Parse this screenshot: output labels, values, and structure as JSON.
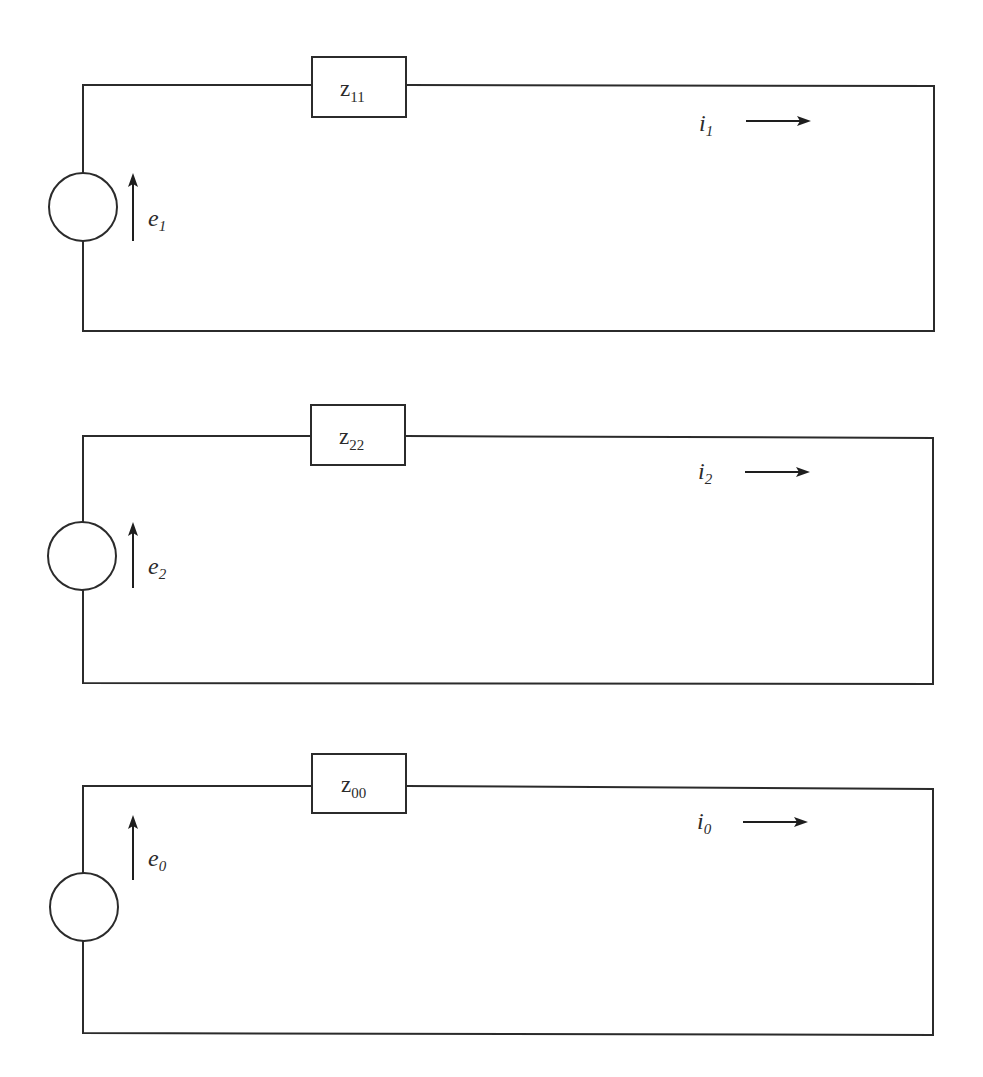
{
  "figure": {
    "colors": {
      "line": "#2b2b2b",
      "background": "#ffffff"
    },
    "circuits": [
      {
        "id": "circuit-1",
        "impedance": {
          "symbol": "z",
          "subscript": "11"
        },
        "source": {
          "symbol": "e",
          "subscript": "1",
          "direction": "up"
        },
        "current": {
          "symbol": "i",
          "subscript": "1",
          "direction": "right"
        }
      },
      {
        "id": "circuit-2",
        "impedance": {
          "symbol": "z",
          "subscript": "22"
        },
        "source": {
          "symbol": "e",
          "subscript": "2",
          "direction": "up"
        },
        "current": {
          "symbol": "i",
          "subscript": "2",
          "direction": "right"
        }
      },
      {
        "id": "circuit-0",
        "impedance": {
          "symbol": "z",
          "subscript": "00"
        },
        "source": {
          "symbol": "e",
          "subscript": "0",
          "direction": "up"
        },
        "current": {
          "symbol": "i",
          "subscript": "0",
          "direction": "right"
        }
      }
    ]
  }
}
